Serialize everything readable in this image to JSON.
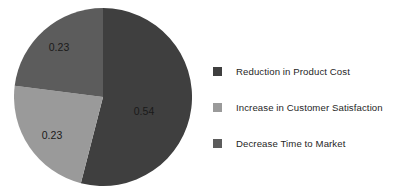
{
  "chart_data": {
    "type": "pie",
    "title": "",
    "categories": [
      "Reduction in Product Cost",
      "Increase in Customer Satisfaction",
      "Decrease Time to Market"
    ],
    "values": [
      0.54,
      0.23,
      0.23
    ],
    "data_labels": [
      "0.54",
      "0.23",
      "0.23"
    ],
    "colors": [
      "#3f3f3f",
      "#9a9a9a",
      "#5c5c5c"
    ],
    "legend_position": "right",
    "grid": false,
    "start_angle_deg": 0,
    "direction": "clockwise",
    "slices": [
      {
        "name": "Reduction in Product Cost",
        "value": 0.54,
        "label": "0.54",
        "color": "#3f3f3f",
        "label_x": 130,
        "label_y": 104
      },
      {
        "name": "Increase in Customer Satisfaction",
        "value": 0.23,
        "label": "0.23",
        "color": "#9a9a9a",
        "label_x": 38,
        "label_y": 128
      },
      {
        "name": "Decrease Time to Market",
        "value": 0.23,
        "label": "0.23",
        "color": "#5c5c5c",
        "label_x": 45,
        "label_y": 40
      }
    ]
  },
  "legend": {
    "items": [
      {
        "label": "Reduction in Product Cost",
        "color": "#3f3f3f"
      },
      {
        "label": "Increase in Customer Satisfaction",
        "color": "#9a9a9a"
      },
      {
        "label": "Decrease Time to Market",
        "color": "#5c5c5c"
      }
    ]
  }
}
